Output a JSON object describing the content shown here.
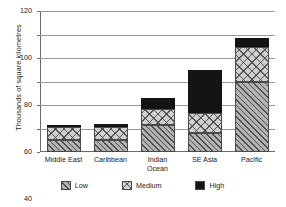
{
  "chart_data": {
    "type": "bar",
    "subtype": "stacked-vertical",
    "title": "",
    "xlabel": "",
    "ylabel": "Thousands of square kilometres",
    "ylim": [
      0,
      120
    ],
    "ytick_step": 20,
    "yticks": [
      0,
      20,
      40,
      60,
      80,
      100,
      120
    ],
    "grid": true,
    "legend_position": "bottom",
    "categories": [
      "Middle East",
      "Caribbean",
      "Indian Ocean",
      "SE Asia",
      "Pacific"
    ],
    "category_lines": [
      [
        "Middle East"
      ],
      [
        "Caribbean"
      ],
      [
        "Indian",
        "Ocean"
      ],
      [
        "SE Asia"
      ],
      [
        "Pacific"
      ]
    ],
    "series": [
      {
        "name": "Low",
        "pattern": "diagonal-hatch",
        "color": "#b3b3b3",
        "values": [
          10,
          10,
          23,
          16,
          60
        ]
      },
      {
        "name": "Medium",
        "pattern": "cross-hatch",
        "color": "#cfcfcf",
        "values": [
          11,
          11,
          14,
          17,
          29
        ]
      },
      {
        "name": "High",
        "pattern": "solid",
        "color": "#141414",
        "values": [
          2,
          3,
          9,
          37,
          8
        ]
      }
    ],
    "totals": [
      23,
      24,
      46,
      70,
      97
    ]
  },
  "axis": {
    "tick_labels": [
      "0",
      "20",
      "40",
      "60",
      "80",
      "100",
      "120"
    ]
  },
  "legend": {
    "items": [
      {
        "label": "Low"
      },
      {
        "label": "Medium"
      },
      {
        "label": "High"
      }
    ]
  }
}
